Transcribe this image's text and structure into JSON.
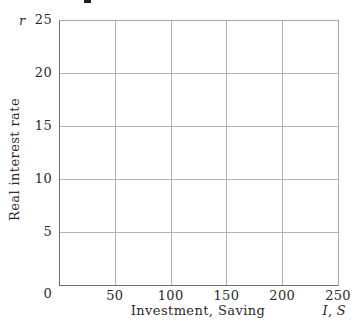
{
  "chart_data": {
    "type": "line",
    "series": [],
    "title": "",
    "xlabel": "Investment, Saving",
    "x_axis_symbol": "I, S",
    "ylabel": "Real interest rate",
    "y_axis_symbol": "r",
    "xlim": [
      0,
      250
    ],
    "ylim": [
      0,
      25
    ],
    "x_ticks": [
      0,
      50,
      100,
      150,
      200,
      250
    ],
    "y_ticks": [
      0,
      5,
      10,
      15,
      20,
      25
    ],
    "grid": true,
    "legend_position": "none"
  },
  "colors": {
    "gridline": "#b4b4b4",
    "axis": "#6e6e6e",
    "frame": "#ababab",
    "text": "#2b2b2b",
    "background": "#ffffff"
  }
}
